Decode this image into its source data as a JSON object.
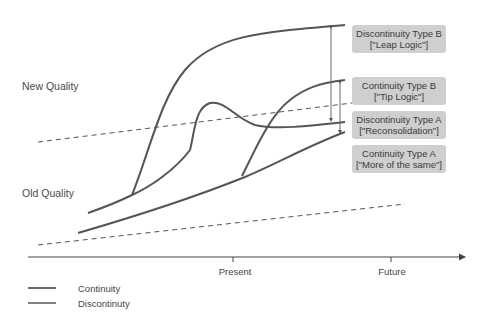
{
  "diagram": {
    "y_labels": {
      "new_quality": "New Quality",
      "old_quality": "Old Quality"
    },
    "boxes": [
      {
        "title": "Discontinuity Type B",
        "subtitle": "[\"Leap Logic\"]"
      },
      {
        "title": "Continuity Type B",
        "subtitle": "[\"Tip Logic\"]"
      },
      {
        "title": "Discontinuity Type A",
        "subtitle": "[\"Reconsolidation\"]"
      },
      {
        "title": "Continuity Type A",
        "subtitle": "[\"More of the same\"]"
      }
    ],
    "x_axis": {
      "ticks": [
        "Present",
        "Future"
      ]
    },
    "legend": [
      {
        "label": "Continuity",
        "color": "#6b6b6b"
      },
      {
        "label": "Discontinuty",
        "color": "#808080"
      }
    ],
    "colors": {
      "curve": "#555555",
      "box_bg": "#cfcfcf",
      "dashed": "#555555"
    }
  }
}
